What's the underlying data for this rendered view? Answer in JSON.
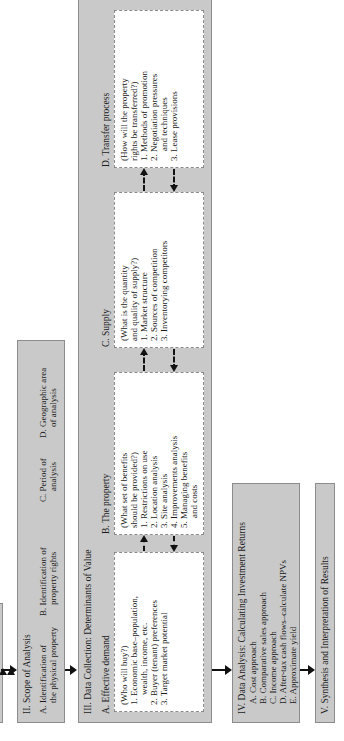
{
  "diagram": {
    "orientation": "rotated 90 degrees counter-clockwise",
    "step1": {
      "label": ""
    },
    "step2": {
      "title": "II. Scope of Analysis",
      "items": [
        {
          "letter": "A.",
          "line1": "Identification of",
          "line2": "the physical property"
        },
        {
          "letter": "B.",
          "line1": "Identification of",
          "line2": "property rights"
        },
        {
          "letter": "C.",
          "line1": "Period of",
          "line2": "analysis"
        },
        {
          "letter": "D.",
          "line1": "Geographic area",
          "line2": "of analysis"
        }
      ]
    },
    "step3": {
      "title": "III. Data Collection:  Determinants of Value",
      "boxes": [
        {
          "heading": "A. Effective demand",
          "question": "(Who will buy?)",
          "lines": [
            "1. Economic base–population,",
            "wealth, income, etc.",
            "2. Buyer (tenant) preferences",
            "3. Target market potential"
          ]
        },
        {
          "heading": "B. The property",
          "question1": "(What set of benefits",
          "question2": "should be provided?)",
          "lines": [
            "1. Restrictions on use",
            "2. Location analysis",
            "3. Site analysis",
            "4. Improvements analysis",
            "5. Managing benefits",
            "and costs"
          ]
        },
        {
          "heading": "C. Supply",
          "question1": "(What is the quantity",
          "question2": "and quality of supply?)",
          "lines": [
            "1. Market structure",
            "2. Sources of competition",
            "3. Inventorying competitors"
          ]
        },
        {
          "heading": "D. Transfer process",
          "question1": "(How will the property",
          "question2": "rights be transferred?)",
          "lines": [
            "1. Methods of promotion",
            "2. Negotiation pressures",
            "and techniques",
            "3. Lease provisions"
          ]
        }
      ]
    },
    "step4": {
      "title": "IV. Data Analysis:  Calculating Investment Returns",
      "items": [
        "A. Cost approach",
        "B. Comparative sales approach",
        "C. Income approach",
        "D. After-tax cash flows–calculate NPVs",
        "E. Approximate yield"
      ]
    },
    "step5": {
      "title": "V. Synthesis and Interpretation of Results"
    },
    "colors": {
      "box_fill": "#c9c9c9",
      "inner_fill": "#ffffff",
      "arrow": "#111111"
    }
  }
}
